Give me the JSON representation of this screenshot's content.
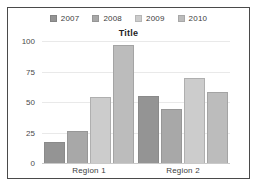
{
  "chart_data": {
    "type": "bar",
    "title": "Title",
    "xlabel": "",
    "ylabel": "",
    "categories": [
      "Region 1",
      "Region 2"
    ],
    "series": [
      {
        "name": "2007",
        "values": [
          17,
          55
        ],
        "color": "#949494"
      },
      {
        "name": "2008",
        "values": [
          26,
          44
        ],
        "color": "#a8a8a8"
      },
      {
        "name": "2009",
        "values": [
          54,
          70
        ],
        "color": "#cccccc"
      },
      {
        "name": "2010",
        "values": [
          97,
          58
        ],
        "color": "#bcbcbc"
      }
    ],
    "ylim": [
      0,
      100
    ],
    "yticks": [
      0,
      25,
      50,
      75,
      100
    ],
    "ytick_labels": [
      "0",
      "25",
      "50",
      "75",
      "100"
    ],
    "grid": true,
    "legend_position": "top"
  },
  "legend": {
    "items": [
      {
        "label": "2007"
      },
      {
        "label": "2008"
      },
      {
        "label": "2009"
      },
      {
        "label": "2010"
      }
    ]
  },
  "colors": {
    "frame_border": "#4a4a4a",
    "background": "#ffffff",
    "gridline": "#e9e9e9",
    "axis_text": "#4a4a4a",
    "title_text": "#1f1f1f"
  }
}
